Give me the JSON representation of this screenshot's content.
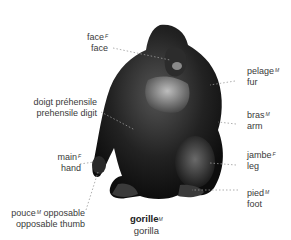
{
  "diagram": {
    "subject": {
      "fr": "gorille",
      "gender": "M",
      "en": "gorilla"
    },
    "labels": [
      {
        "id": "face",
        "fr": "face",
        "gender": "F",
        "en": "face",
        "side": "left"
      },
      {
        "id": "pelage",
        "fr": "pelage",
        "gender": "M",
        "en": "fur",
        "side": "right"
      },
      {
        "id": "doigt",
        "fr": "doigt préhensile",
        "gender": "M",
        "en": "prehensile digit",
        "side": "left"
      },
      {
        "id": "bras",
        "fr": "bras",
        "gender": "M",
        "en": "arm",
        "side": "right"
      },
      {
        "id": "main",
        "fr": "main",
        "gender": "F",
        "en": "hand",
        "side": "left"
      },
      {
        "id": "jambe",
        "fr": "jambe",
        "gender": "F",
        "en": "leg",
        "side": "right"
      },
      {
        "id": "pouce",
        "fr": "pouce",
        "gender": "M",
        "fr_suffix": "opposable",
        "en": "opposable thumb",
        "side": "left"
      },
      {
        "id": "pied",
        "fr": "pied",
        "gender": "M",
        "en": "foot",
        "side": "right"
      }
    ]
  }
}
